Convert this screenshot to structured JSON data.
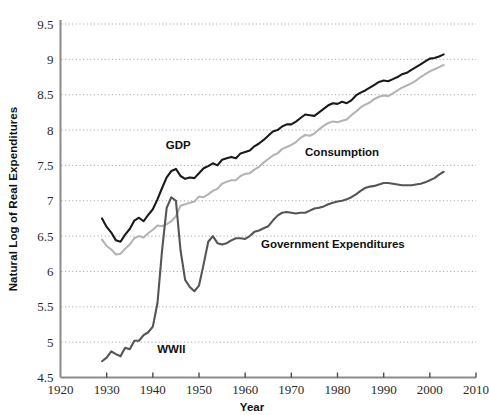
{
  "chart_data": {
    "type": "line",
    "title": "",
    "xlabel": "Year",
    "ylabel": "Natural Log of Real Expenditures",
    "xlim": [
      1920,
      2010
    ],
    "ylim": [
      4.5,
      9.5
    ],
    "xticks": [
      1920,
      1930,
      1940,
      1950,
      1960,
      1970,
      1980,
      1990,
      2000,
      2010
    ],
    "yticks": [
      4.5,
      5,
      5.5,
      6,
      6.5,
      7,
      7.5,
      8,
      8.5,
      9,
      9.5
    ],
    "xtick_labels": [
      "1920",
      "1930",
      "1940",
      "1950",
      "1960",
      "1970",
      "1980",
      "1990",
      "2000",
      "2010"
    ],
    "ytick_labels": [
      "4.5",
      "5",
      "5.5",
      "6",
      "6.5",
      "7",
      "7.5",
      "8",
      "8.5",
      "9",
      "9.5"
    ],
    "grid": "horizontal-dotted",
    "legend_position": "inline-annotations",
    "annotations": [
      {
        "name": "wwii",
        "text": "WWII",
        "x": 1944,
        "y": 4.85
      },
      {
        "name": "gdp",
        "text": "GDP",
        "x": 1945.5,
        "y": 7.73
      },
      {
        "name": "consumption",
        "text": "Consumption",
        "x": 1981,
        "y": 7.63
      },
      {
        "name": "government",
        "text": "Government Expenditures",
        "x": 1979,
        "y": 6.33
      }
    ],
    "series": [
      {
        "name": "GDP",
        "color": "#1a1a1a",
        "label": "GDP",
        "x": [
          1929,
          1930,
          1931,
          1932,
          1933,
          1934,
          1935,
          1936,
          1937,
          1938,
          1939,
          1940,
          1941,
          1942,
          1943,
          1944,
          1945,
          1946,
          1947,
          1948,
          1949,
          1950,
          1951,
          1952,
          1953,
          1954,
          1955,
          1956,
          1957,
          1958,
          1959,
          1960,
          1961,
          1962,
          1963,
          1964,
          1965,
          1966,
          1967,
          1968,
          1969,
          1970,
          1971,
          1972,
          1973,
          1974,
          1975,
          1976,
          1977,
          1978,
          1979,
          1980,
          1981,
          1982,
          1983,
          1984,
          1985,
          1986,
          1987,
          1988,
          1989,
          1990,
          1991,
          1992,
          1993,
          1994,
          1995,
          1996,
          1997,
          1998,
          1999,
          2000,
          2001,
          2002,
          2003
        ],
        "y": [
          6.75,
          6.63,
          6.55,
          6.44,
          6.42,
          6.52,
          6.6,
          6.72,
          6.76,
          6.71,
          6.8,
          6.88,
          7.02,
          7.18,
          7.33,
          7.42,
          7.45,
          7.35,
          7.31,
          7.33,
          7.32,
          7.39,
          7.46,
          7.49,
          7.53,
          7.5,
          7.58,
          7.6,
          7.62,
          7.6,
          7.67,
          7.69,
          7.71,
          7.77,
          7.81,
          7.86,
          7.92,
          7.98,
          8.0,
          8.05,
          8.08,
          8.08,
          8.12,
          8.17,
          8.22,
          8.21,
          8.2,
          8.25,
          8.3,
          8.35,
          8.38,
          8.37,
          8.4,
          8.38,
          8.42,
          8.49,
          8.53,
          8.56,
          8.6,
          8.64,
          8.68,
          8.7,
          8.69,
          8.72,
          8.75,
          8.79,
          8.81,
          8.85,
          8.89,
          8.93,
          8.97,
          9.01,
          9.02,
          9.04,
          9.07
        ],
        "y_at_key_years": {
          "1929": 6.75,
          "1933": 6.42,
          "1944": 7.42,
          "1950": 7.39,
          "1970": 8.08,
          "1990": 8.7,
          "2003": 9.07
        }
      },
      {
        "name": "Consumption",
        "color": "#b4b4b4",
        "label": "Consumption",
        "x": [
          1929,
          1930,
          1931,
          1932,
          1933,
          1934,
          1935,
          1936,
          1937,
          1938,
          1939,
          1940,
          1941,
          1942,
          1943,
          1944,
          1945,
          1946,
          1947,
          1948,
          1949,
          1950,
          1951,
          1952,
          1953,
          1954,
          1955,
          1956,
          1957,
          1958,
          1959,
          1960,
          1961,
          1962,
          1963,
          1964,
          1965,
          1966,
          1967,
          1968,
          1969,
          1970,
          1971,
          1972,
          1973,
          1974,
          1975,
          1976,
          1977,
          1978,
          1979,
          1980,
          1981,
          1982,
          1983,
          1984,
          1985,
          1986,
          1987,
          1988,
          1989,
          1990,
          1991,
          1992,
          1993,
          1994,
          1995,
          1996,
          1997,
          1998,
          1999,
          2000,
          2001,
          2002,
          2003
        ],
        "y": [
          6.45,
          6.36,
          6.31,
          6.24,
          6.25,
          6.32,
          6.38,
          6.47,
          6.5,
          6.48,
          6.54,
          6.59,
          6.65,
          6.64,
          6.67,
          6.71,
          6.78,
          6.93,
          6.95,
          6.97,
          6.99,
          7.06,
          7.05,
          7.09,
          7.14,
          7.17,
          7.24,
          7.27,
          7.29,
          7.29,
          7.35,
          7.38,
          7.39,
          7.44,
          7.48,
          7.54,
          7.59,
          7.64,
          7.67,
          7.73,
          7.76,
          7.79,
          7.83,
          7.89,
          7.93,
          7.92,
          7.95,
          8.01,
          8.06,
          8.1,
          8.12,
          8.11,
          8.13,
          8.15,
          8.21,
          8.26,
          8.32,
          8.36,
          8.39,
          8.44,
          8.47,
          8.49,
          8.48,
          8.52,
          8.56,
          8.6,
          8.63,
          8.66,
          8.7,
          8.75,
          8.79,
          8.83,
          8.86,
          8.89,
          8.92
        ],
        "y_at_key_years": {
          "1929": 6.45,
          "1933": 6.25,
          "1944": 6.71,
          "1950": 7.06,
          "1970": 7.79,
          "1990": 8.49,
          "2003": 8.92
        }
      },
      {
        "name": "Government Expenditures",
        "color": "#555555",
        "label": "Government Expenditures",
        "x": [
          1929,
          1930,
          1931,
          1932,
          1933,
          1934,
          1935,
          1936,
          1937,
          1938,
          1939,
          1940,
          1941,
          1942,
          1943,
          1944,
          1945,
          1946,
          1947,
          1948,
          1949,
          1950,
          1951,
          1952,
          1953,
          1954,
          1955,
          1956,
          1957,
          1958,
          1959,
          1960,
          1961,
          1962,
          1963,
          1964,
          1965,
          1966,
          1967,
          1968,
          1969,
          1970,
          1971,
          1972,
          1973,
          1974,
          1975,
          1976,
          1977,
          1978,
          1979,
          1980,
          1981,
          1982,
          1983,
          1984,
          1985,
          1986,
          1987,
          1988,
          1989,
          1990,
          1991,
          1992,
          1993,
          1994,
          1995,
          1996,
          1997,
          1998,
          1999,
          2000,
          2001,
          2002,
          2003
        ],
        "y": [
          4.73,
          4.78,
          4.87,
          4.83,
          4.8,
          4.92,
          4.9,
          5.02,
          5.02,
          5.1,
          5.14,
          5.22,
          5.55,
          6.3,
          6.9,
          7.05,
          7.0,
          6.3,
          5.88,
          5.78,
          5.72,
          5.8,
          6.1,
          6.42,
          6.5,
          6.4,
          6.38,
          6.4,
          6.44,
          6.47,
          6.47,
          6.46,
          6.5,
          6.56,
          6.58,
          6.61,
          6.64,
          6.72,
          6.79,
          6.83,
          6.84,
          6.83,
          6.82,
          6.83,
          6.83,
          6.86,
          6.89,
          6.9,
          6.92,
          6.95,
          6.97,
          6.99,
          7.0,
          7.02,
          7.05,
          7.09,
          7.14,
          7.18,
          7.2,
          7.21,
          7.23,
          7.25,
          7.25,
          7.24,
          7.23,
          7.22,
          7.22,
          7.22,
          7.23,
          7.24,
          7.26,
          7.29,
          7.32,
          7.37,
          7.41
        ],
        "y_at_key_years": {
          "1929": 4.73,
          "1933": 4.8,
          "1944": 7.05,
          "1950": 5.8,
          "1970": 6.83,
          "1990": 7.25,
          "2003": 7.41
        }
      }
    ]
  },
  "axis": {
    "x_title": "Year",
    "y_title": "Natural Log of Real Expenditures"
  },
  "colors": {
    "gdp": "#1a1a1a",
    "consumption": "#b4b4b4",
    "government": "#555555",
    "axis": "#8a8a8a",
    "grid": "#9a9aa8",
    "background": "#ffffff"
  }
}
